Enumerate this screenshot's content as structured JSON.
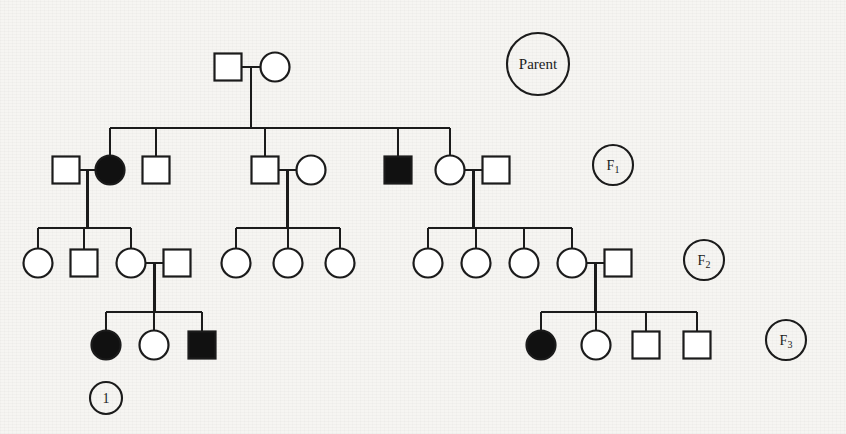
{
  "figure": {
    "background_color": "#f6f5f2",
    "line_color": "#1b1b1b",
    "affected_fill": "#111111",
    "unaffected_fill": "#ffffff"
  },
  "legend_labels": {
    "parent": "Parent",
    "f1": "F",
    "f1_sub": "1",
    "f2": "F",
    "f2_sub": "2",
    "f3": "F",
    "f3_sub": "3",
    "marker_one": "1"
  },
  "generations": [
    {
      "name": "Parent",
      "label": "Parent",
      "label_cx": 538,
      "label_cy": 64,
      "label_r": 31,
      "y": 67,
      "individuals": [
        {
          "id": "P1",
          "sex": "male",
          "shape": "square",
          "affected": false,
          "cx": 228,
          "cy": 67
        },
        {
          "id": "P2",
          "sex": "female",
          "shape": "circle",
          "affected": false,
          "cx": 275,
          "cy": 67
        }
      ]
    },
    {
      "name": "F1",
      "label": "F1",
      "label_cx": 613,
      "label_cy": 165,
      "label_r": 20,
      "y": 170,
      "individuals": [
        {
          "id": "A1",
          "sex": "male",
          "shape": "square",
          "affected": false,
          "cx": 66,
          "cy": 170,
          "spouse": true
        },
        {
          "id": "A2",
          "sex": "female",
          "shape": "circle",
          "affected": true,
          "cx": 110,
          "cy": 170,
          "child_of": "Parent"
        },
        {
          "id": "A3",
          "sex": "male",
          "shape": "square",
          "affected": false,
          "cx": 156,
          "cy": 170,
          "child_of": "Parent"
        },
        {
          "id": "B1",
          "sex": "male",
          "shape": "square",
          "affected": false,
          "cx": 265,
          "cy": 170,
          "child_of": "Parent"
        },
        {
          "id": "B2",
          "sex": "female",
          "shape": "circle",
          "affected": false,
          "cx": 311,
          "cy": 170,
          "spouse": true
        },
        {
          "id": "C1",
          "sex": "male",
          "shape": "square",
          "affected": true,
          "cx": 398,
          "cy": 170,
          "child_of": "Parent"
        },
        {
          "id": "C2",
          "sex": "female",
          "shape": "circle",
          "affected": false,
          "cx": 450,
          "cy": 170,
          "child_of": "Parent"
        },
        {
          "id": "C3",
          "sex": "male",
          "shape": "square",
          "affected": false,
          "cx": 496,
          "cy": 170,
          "spouse": true
        }
      ]
    },
    {
      "name": "F2",
      "label": "F2",
      "label_cx": 704,
      "label_cy": 260,
      "label_r": 20,
      "y": 263,
      "individuals": [
        {
          "id": "D1",
          "sex": "female",
          "shape": "circle",
          "affected": false,
          "cx": 38,
          "cy": 263
        },
        {
          "id": "D2",
          "sex": "male",
          "shape": "square",
          "affected": false,
          "cx": 84,
          "cy": 263
        },
        {
          "id": "D3",
          "sex": "female",
          "shape": "circle",
          "affected": false,
          "cx": 131,
          "cy": 263
        },
        {
          "id": "D4",
          "sex": "male",
          "shape": "square",
          "affected": false,
          "cx": 177,
          "cy": 263,
          "spouse": true
        },
        {
          "id": "E1",
          "sex": "female",
          "shape": "circle",
          "affected": false,
          "cx": 236,
          "cy": 263
        },
        {
          "id": "E2",
          "sex": "female",
          "shape": "circle",
          "affected": false,
          "cx": 288,
          "cy": 263
        },
        {
          "id": "E3",
          "sex": "female",
          "shape": "circle",
          "affected": false,
          "cx": 340,
          "cy": 263
        },
        {
          "id": "F1c",
          "sex": "female",
          "shape": "circle",
          "affected": false,
          "cx": 428,
          "cy": 263
        },
        {
          "id": "F2c",
          "sex": "female",
          "shape": "circle",
          "affected": false,
          "cx": 476,
          "cy": 263
        },
        {
          "id": "F3c",
          "sex": "female",
          "shape": "circle",
          "affected": false,
          "cx": 524,
          "cy": 263
        },
        {
          "id": "F4c",
          "sex": "female",
          "shape": "circle",
          "affected": false,
          "cx": 572,
          "cy": 263
        },
        {
          "id": "F5s",
          "sex": "male",
          "shape": "square",
          "affected": false,
          "cx": 618,
          "cy": 263,
          "spouse": true
        }
      ]
    },
    {
      "name": "F3",
      "label": "F3",
      "label_cx": 786,
      "label_cy": 340,
      "label_r": 20,
      "y": 345,
      "individuals": [
        {
          "id": "G1",
          "sex": "female",
          "shape": "circle",
          "affected": true,
          "cx": 106,
          "cy": 345
        },
        {
          "id": "G2",
          "sex": "female",
          "shape": "circle",
          "affected": false,
          "cx": 154,
          "cy": 345
        },
        {
          "id": "G3",
          "sex": "male",
          "shape": "square",
          "affected": true,
          "cx": 202,
          "cy": 345
        },
        {
          "id": "H1",
          "sex": "female",
          "shape": "circle",
          "affected": true,
          "cx": 541,
          "cy": 345
        },
        {
          "id": "H2",
          "sex": "female",
          "shape": "circle",
          "affected": false,
          "cx": 596,
          "cy": 345
        },
        {
          "id": "H3",
          "sex": "male",
          "shape": "square",
          "affected": false,
          "cx": 646,
          "cy": 345
        },
        {
          "id": "H4",
          "sex": "male",
          "shape": "square",
          "affected": false,
          "cx": 697,
          "cy": 345
        }
      ]
    }
  ],
  "annotations": [
    {
      "id": "marker-1",
      "label": "1",
      "cx": 106,
      "cy": 398,
      "r": 16,
      "points_to": "G1"
    }
  ],
  "counts": {
    "parent_individuals": 2,
    "f1_individuals": 8,
    "f2_individuals": 12,
    "f3_individuals": 7,
    "total_affected": 6
  }
}
